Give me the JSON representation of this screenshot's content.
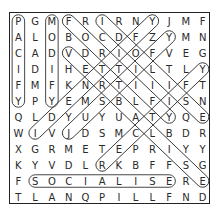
{
  "puzzle": {
    "rows": 12,
    "cols": 12,
    "grid": [
      [
        "P",
        "G",
        "M",
        "F",
        "R",
        "I",
        "R",
        "N",
        "Y",
        "J",
        "M",
        "F"
      ],
      [
        "A",
        "L",
        "O",
        "B",
        "O",
        "C",
        "D",
        "F",
        "Z",
        "Y",
        "M",
        "N"
      ],
      [
        "C",
        "A",
        "D",
        "V",
        "D",
        "R",
        "I",
        "O",
        "F",
        "V",
        "E",
        "G"
      ],
      [
        "I",
        "D",
        "I",
        "H",
        "E",
        "T",
        "T",
        "I",
        "L",
        "T",
        "L",
        "Y"
      ],
      [
        "F",
        "M",
        "F",
        "K",
        "N",
        "R",
        "T",
        "I",
        "I",
        "I",
        "F",
        "T"
      ],
      [
        "Y",
        "P",
        "Y",
        "E",
        "M",
        "S",
        "B",
        "L",
        "F",
        "I",
        "S",
        "N"
      ],
      [
        "Q",
        "L",
        "D",
        "Y",
        "U",
        "Y",
        "U",
        "A",
        "T",
        "Y",
        "Q",
        "E"
      ],
      [
        "W",
        "I",
        "V",
        "J",
        "D",
        "S",
        "M",
        "C",
        "L",
        "B",
        "D",
        "R"
      ],
      [
        "X",
        "G",
        "R",
        "M",
        "E",
        "T",
        "E",
        "P",
        "R",
        "I",
        "Y",
        "Y"
      ],
      [
        "K",
        "Y",
        "V",
        "D",
        "L",
        "R",
        "K",
        "B",
        "F",
        "F",
        "S",
        "G"
      ],
      [
        "F",
        "S",
        "O",
        "C",
        "I",
        "A",
        "L",
        "I",
        "S",
        "E",
        "R",
        "E"
      ],
      [
        "T",
        "L",
        "A",
        "N",
        "Q",
        "P",
        "I",
        "L",
        "L",
        "F",
        "N",
        "D"
      ]
    ],
    "found_words": [
      {
        "word": "PACIFY",
        "start": [
          0,
          0
        ],
        "end": [
          5,
          0
        ]
      },
      {
        "word": "MODIFY",
        "start": [
          0,
          2
        ],
        "end": [
          5,
          2
        ]
      },
      {
        "word": "FORTIFY",
        "start": [
          0,
          3
        ],
        "end": [
          6,
          9
        ]
      },
      {
        "word": "IDOLISE",
        "start": [
          0,
          5
        ],
        "end": [
          6,
          11
        ]
      },
      {
        "word": "IDENTIFY",
        "start": [
          7,
          1
        ],
        "end": [
          0,
          8
        ]
      },
      {
        "word": "JUSTIFY",
        "start": [
          7,
          3
        ],
        "end": [
          1,
          9
        ]
      },
      {
        "word": "VERBALISE",
        "start": [
          2,
          3
        ],
        "end": [
          10,
          11
        ]
      },
      {
        "word": "RECTIFY",
        "start": [
          9,
          5
        ],
        "end": [
          3,
          11
        ]
      },
      {
        "word": "SOCIALISE",
        "start": [
          10,
          1
        ],
        "end": [
          10,
          9
        ]
      }
    ]
  }
}
